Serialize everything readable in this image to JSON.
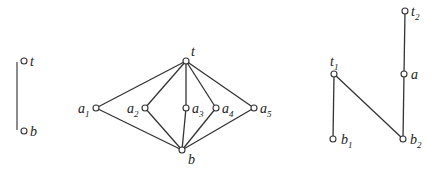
{
  "diagrams": [
    {
      "id": "chain",
      "nodes": [
        {
          "id": "t",
          "label": "t",
          "sub": "",
          "x": 24,
          "y": 61,
          "lx": 30,
          "ly": 66
        },
        {
          "id": "b",
          "label": "b",
          "sub": "",
          "x": 24,
          "y": 131,
          "lx": 30,
          "ly": 136
        }
      ],
      "edges": [],
      "bar": {
        "x": 17,
        "y1": 62,
        "y2": 130
      }
    },
    {
      "id": "m5",
      "nodes": [
        {
          "id": "t",
          "label": "t",
          "sub": "",
          "x": 186,
          "y": 61,
          "lx": 191,
          "ly": 56
        },
        {
          "id": "a1",
          "label": "a",
          "sub": "1",
          "x": 96,
          "y": 108,
          "lx": 78,
          "ly": 113
        },
        {
          "id": "a2",
          "label": "a",
          "sub": "2",
          "x": 145,
          "y": 108,
          "lx": 127,
          "ly": 113
        },
        {
          "id": "a3",
          "label": "a",
          "sub": "3",
          "x": 186,
          "y": 108,
          "lx": 192,
          "ly": 113
        },
        {
          "id": "a4",
          "label": "a",
          "sub": "4",
          "x": 216,
          "y": 108,
          "lx": 222,
          "ly": 113
        },
        {
          "id": "a5",
          "label": "a",
          "sub": "5",
          "x": 254,
          "y": 108,
          "lx": 260,
          "ly": 113
        },
        {
          "id": "b",
          "label": "b",
          "sub": "",
          "x": 182,
          "y": 150,
          "lx": 188,
          "ly": 164
        }
      ],
      "edges": [
        [
          "t",
          "a1"
        ],
        [
          "t",
          "a2"
        ],
        [
          "t",
          "a3"
        ],
        [
          "t",
          "a4"
        ],
        [
          "t",
          "a5"
        ],
        [
          "a1",
          "b"
        ],
        [
          "a2",
          "b"
        ],
        [
          "a3",
          "b"
        ],
        [
          "a4",
          "b"
        ],
        [
          "a5",
          "b"
        ]
      ]
    },
    {
      "id": "n",
      "nodes": [
        {
          "id": "t2",
          "label": "t",
          "sub": "2",
          "x": 405,
          "y": 11,
          "lx": 411,
          "ly": 16
        },
        {
          "id": "a",
          "label": "a",
          "sub": "",
          "x": 404,
          "y": 74,
          "lx": 411,
          "ly": 79
        },
        {
          "id": "t1",
          "label": "t",
          "sub": "1",
          "x": 334,
          "y": 74,
          "lx": 330,
          "ly": 66
        },
        {
          "id": "b1",
          "label": "b",
          "sub": "1",
          "x": 333,
          "y": 139,
          "lx": 341,
          "ly": 144
        },
        {
          "id": "b2",
          "label": "b",
          "sub": "2",
          "x": 403,
          "y": 139,
          "lx": 410,
          "ly": 144
        }
      ],
      "edges": [
        [
          "t2",
          "a"
        ],
        [
          "a",
          "b2"
        ],
        [
          "t1",
          "b2"
        ],
        [
          "t1",
          "b1"
        ]
      ]
    }
  ]
}
